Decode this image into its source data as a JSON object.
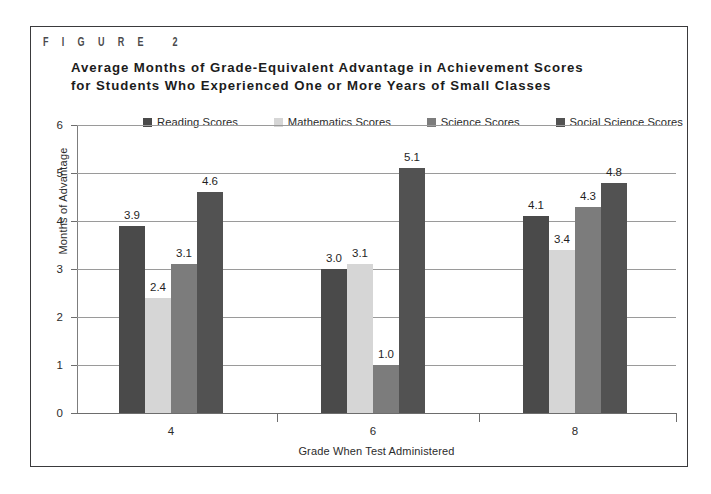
{
  "figure": {
    "label": "F I G U R E   2"
  },
  "chart_data": {
    "type": "bar",
    "title": "Average Months of Grade-Equivalent Advantage in Achievement Scores for Students Who Experienced One or More Years of Small Classes",
    "title_lines": [
      "Average Months of Grade-Equivalent Advantage in Achievement Scores",
      "for Students Who Experienced One or More Years of Small Classes"
    ],
    "xlabel": "Grade When Test Administered",
    "ylabel": "Months of Advantage",
    "categories": [
      "4",
      "6",
      "8"
    ],
    "ylim": [
      0,
      6
    ],
    "yticks": [
      "0",
      "1",
      "2",
      "3",
      "4",
      "5",
      "6"
    ],
    "grid": true,
    "legend_position": "top",
    "series": [
      {
        "name": "Reading Scores",
        "color": "#4a4a4a",
        "values": [
          3.9,
          3.0,
          4.1
        ],
        "labels": [
          "3.9",
          "3.0",
          "4.1"
        ]
      },
      {
        "name": "Mathematics Scores",
        "color": "#d6d6d6",
        "values": [
          2.4,
          3.1,
          3.4
        ],
        "labels": [
          "2.4",
          "3.1",
          "3.4"
        ]
      },
      {
        "name": "Science Scores",
        "color": "#7c7c7c",
        "values": [
          3.1,
          1.0,
          4.3
        ],
        "labels": [
          "3.1",
          "1.0",
          "4.3"
        ]
      },
      {
        "name": "Social Science Scores",
        "color": "#525252",
        "values": [
          4.6,
          5.1,
          4.8
        ],
        "labels": [
          "4.6",
          "5.1",
          "4.8"
        ]
      }
    ]
  }
}
